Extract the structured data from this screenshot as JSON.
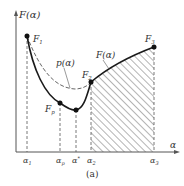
{
  "diagram": {
    "y_axis_label": "F(α)",
    "x_axis_label": "α",
    "caption": "(a)",
    "curve_labels": {
      "p_curve": "p(α)",
      "f_curve": "F(α)"
    },
    "points": [
      {
        "name": "F",
        "sub": "1"
      },
      {
        "name": "F",
        "sub": "p"
      },
      {
        "name": "F",
        "sub": "2"
      },
      {
        "name": "F",
        "sub": "3"
      }
    ],
    "x_ticks": [
      {
        "name": "α",
        "sub": "1"
      },
      {
        "name": "α",
        "sub": "p"
      },
      {
        "name": "α",
        "sub": "*"
      },
      {
        "name": "α",
        "sub": "2"
      },
      {
        "name": "α",
        "sub": "3"
      }
    ],
    "colors": {
      "line": "#1a1a1a",
      "axis": "#555555",
      "hatch": "#444444"
    }
  }
}
